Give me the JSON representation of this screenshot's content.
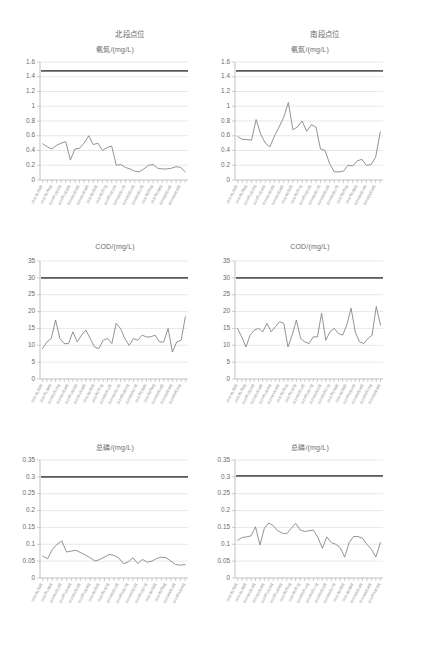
{
  "columns": [
    {
      "id": "north",
      "label": "北段点位"
    },
    {
      "id": "south",
      "label": "南段点位"
    }
  ],
  "x_labels": [
    "2020年1月3日",
    "2020年1月8日",
    "2020年1月13日",
    "2020年1月18日",
    "2020年1月23日",
    "2020年1月28日",
    "2020年2月2日",
    "2020年2月7日",
    "2020年2月12日",
    "2020年2月17日",
    "2020年2月22日",
    "2020年2月27日",
    "2020年3月3日",
    "2020年3月8日",
    "2020年3月13日",
    "2020年3月18日",
    "2020年3月23日",
    "2020年3月28日",
    "2020年4月2日",
    "2020年4月7日",
    "2020年4月12日",
    "2020年4月17日",
    "2020年4月22日",
    "2020年4月27日",
    "2020年5月2日",
    "2020年5月7日",
    "2020年5月12日",
    "2020年5月17日",
    "2020年5月22日",
    "2020年5月27日",
    "2020年6月1日",
    "2020年6月6日"
  ],
  "chart_data": [
    {
      "id": "north-ammonia",
      "type": "line",
      "title": "氨氮/(mg/L)",
      "column": "北段点位",
      "xlabel": "",
      "ylabel": "",
      "ylim": [
        0,
        1.6
      ],
      "yticks": [
        0,
        0.2,
        0.4,
        0.6,
        0.8,
        1,
        1.2,
        1.4,
        1.6
      ],
      "ytick_labels": [
        "0",
        "0.2",
        "0.4",
        "0.6",
        "0.8",
        "1",
        "1.2",
        "1.4",
        "1.6"
      ],
      "grid": true,
      "legend": "none",
      "limit_line": {
        "name": "标准限值",
        "value": 1.48
      },
      "series": [
        {
          "name": "氨氮",
          "values": [
            0.49,
            0.45,
            0.42,
            0.47,
            0.5,
            0.52,
            0.27,
            0.42,
            0.43,
            0.5,
            0.6,
            0.48,
            0.5,
            0.4,
            0.44,
            0.46,
            0.2,
            0.21,
            0.17,
            0.15,
            0.12,
            0.11,
            0.15,
            0.2,
            0.21,
            0.16,
            0.15,
            0.15,
            0.16,
            0.18,
            0.17,
            0.11
          ]
        }
      ]
    },
    {
      "id": "south-ammonia",
      "type": "line",
      "title": "氨氮/(mg/L)",
      "column": "南段点位",
      "xlabel": "",
      "ylabel": "",
      "ylim": [
        0,
        1.6
      ],
      "yticks": [
        0,
        0.2,
        0.4,
        0.6,
        0.8,
        1,
        1.2,
        1.4,
        1.6
      ],
      "ytick_labels": [
        "0",
        "0.2",
        "0.4",
        "0.6",
        "0.8",
        "1",
        "1.2",
        "1.4",
        "1.6"
      ],
      "grid": true,
      "legend": "none",
      "limit_line": {
        "name": "标准限值",
        "value": 1.48
      },
      "series": [
        {
          "name": "氨氮",
          "values": [
            0.59,
            0.55,
            0.55,
            0.54,
            0.82,
            0.62,
            0.5,
            0.45,
            0.6,
            0.72,
            0.85,
            1.05,
            0.68,
            0.72,
            0.8,
            0.66,
            0.75,
            0.72,
            0.42,
            0.4,
            0.22,
            0.11,
            0.11,
            0.12,
            0.2,
            0.19,
            0.26,
            0.28,
            0.2,
            0.21,
            0.31,
            0.65
          ]
        }
      ]
    },
    {
      "id": "north-cod",
      "type": "line",
      "title": "COD/(mg/L)",
      "column": "北段点位",
      "xlabel": "",
      "ylabel": "",
      "ylim": [
        0,
        35
      ],
      "yticks": [
        0,
        5,
        10,
        15,
        20,
        25,
        30,
        35
      ],
      "ytick_labels": [
        "0",
        "5",
        "10",
        "15",
        "20",
        "25",
        "30",
        "35"
      ],
      "grid": true,
      "legend": "none",
      "limit_line": {
        "name": "标准限值",
        "value": 30
      },
      "series": [
        {
          "name": "COD",
          "values": [
            9,
            11,
            12,
            17.5,
            12,
            10.5,
            10.5,
            14,
            11,
            13,
            14.5,
            12,
            9.5,
            9,
            11.5,
            12,
            10.5,
            16.5,
            15,
            12,
            10,
            12,
            11.5,
            13,
            12.5,
            12.5,
            13,
            11,
            11,
            15,
            8,
            11,
            11.5,
            18.5
          ]
        }
      ]
    },
    {
      "id": "south-cod",
      "type": "line",
      "title": "COD/(mg/L)",
      "column": "南段点位",
      "xlabel": "",
      "ylabel": "",
      "ylim": [
        0,
        35
      ],
      "yticks": [
        0,
        5,
        10,
        15,
        20,
        25,
        30,
        35
      ],
      "ytick_labels": [
        "0",
        "5",
        "10",
        "15",
        "20",
        "25",
        "30",
        "35"
      ],
      "grid": true,
      "legend": "none",
      "limit_line": {
        "name": "标准限值",
        "value": 30
      },
      "series": [
        {
          "name": "COD",
          "values": [
            15,
            12.5,
            9.5,
            13,
            14.5,
            15,
            14,
            16.5,
            14,
            15.5,
            17,
            16.5,
            9.5,
            13,
            17.5,
            12,
            11,
            10.5,
            12.5,
            12.5,
            19.5,
            11.5,
            14,
            15,
            13.5,
            13,
            16,
            21,
            14,
            11,
            10.5,
            12,
            13,
            21.5,
            16
          ]
        }
      ]
    },
    {
      "id": "north-tp",
      "type": "line",
      "title": "总磷/(mg/L)",
      "column": "北段点位",
      "xlabel": "",
      "ylabel": "",
      "ylim": [
        0,
        0.35
      ],
      "yticks": [
        0,
        0.05,
        0.1,
        0.15,
        0.2,
        0.25,
        0.3,
        0.35
      ],
      "ytick_labels": [
        "0",
        "0.05",
        "0.1",
        "0.15",
        "0.2",
        "0.25",
        "0.3",
        "0.35"
      ],
      "grid": true,
      "legend": "none",
      "limit_line": {
        "name": "标准限值",
        "value": 0.3
      },
      "series": [
        {
          "name": "总磷",
          "values": [
            0.065,
            0.057,
            0.085,
            0.1,
            0.11,
            0.077,
            0.08,
            0.082,
            0.075,
            0.068,
            0.06,
            0.05,
            0.055,
            0.062,
            0.07,
            0.067,
            0.06,
            0.042,
            0.048,
            0.06,
            0.043,
            0.055,
            0.047,
            0.05,
            0.058,
            0.062,
            0.06,
            0.05,
            0.04,
            0.038,
            0.04
          ]
        }
      ]
    },
    {
      "id": "south-tp",
      "type": "line",
      "title": "总磷/(mg/L)",
      "column": "南段点位",
      "xlabel": "",
      "ylabel": "",
      "ylim": [
        0,
        0.35
      ],
      "yticks": [
        0,
        0.05,
        0.1,
        0.15,
        0.2,
        0.25,
        0.3,
        0.35
      ],
      "ytick_labels": [
        "0",
        "0.05",
        "0.1",
        "0.15",
        "0.2",
        "0.25",
        "0.3",
        "0.35"
      ],
      "grid": true,
      "legend": "none",
      "limit_line": {
        "name": "标准限值",
        "value": 0.303
      },
      "series": [
        {
          "name": "总磷",
          "values": [
            0.112,
            0.12,
            0.122,
            0.125,
            0.152,
            0.098,
            0.148,
            0.163,
            0.155,
            0.14,
            0.133,
            0.131,
            0.147,
            0.162,
            0.143,
            0.138,
            0.14,
            0.142,
            0.12,
            0.088,
            0.122,
            0.105,
            0.1,
            0.09,
            0.062,
            0.105,
            0.123,
            0.123,
            0.118,
            0.1,
            0.085,
            0.062,
            0.105
          ]
        }
      ]
    }
  ],
  "style": {
    "series_color": "#7f7f7f",
    "limit_color": "#595959",
    "grid_color": "#d9d9d9",
    "axis_color": "#a6a6a6",
    "text_color": "#6b6b6b",
    "background": "#ffffff"
  }
}
